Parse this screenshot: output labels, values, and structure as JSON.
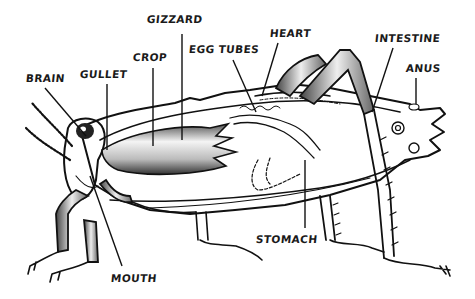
{
  "diagram": {
    "labels": [
      {
        "id": "brain",
        "text": "BRAIN",
        "x": 26,
        "y": 72
      },
      {
        "id": "gullet",
        "text": "GULLET",
        "x": 80,
        "y": 68
      },
      {
        "id": "crop",
        "text": "CROP",
        "x": 133,
        "y": 51
      },
      {
        "id": "gizzard",
        "text": "GIZZARD",
        "x": 147,
        "y": 13
      },
      {
        "id": "egg_tubes",
        "text": "EGG TUBES",
        "x": 189,
        "y": 43
      },
      {
        "id": "heart",
        "text": "HEART",
        "x": 270,
        "y": 27
      },
      {
        "id": "intestine",
        "text": "INTESTINE",
        "x": 375,
        "y": 32
      },
      {
        "id": "anus",
        "text": "ANUS",
        "x": 406,
        "y": 62
      },
      {
        "id": "stomach",
        "text": "STOMACH",
        "x": 256,
        "y": 233
      },
      {
        "id": "mouth",
        "text": "MOUTH",
        "x": 111,
        "y": 272
      }
    ],
    "colors": {
      "ink": "#111111",
      "background": "#ffffff",
      "shading": "#9a9a9a"
    }
  }
}
